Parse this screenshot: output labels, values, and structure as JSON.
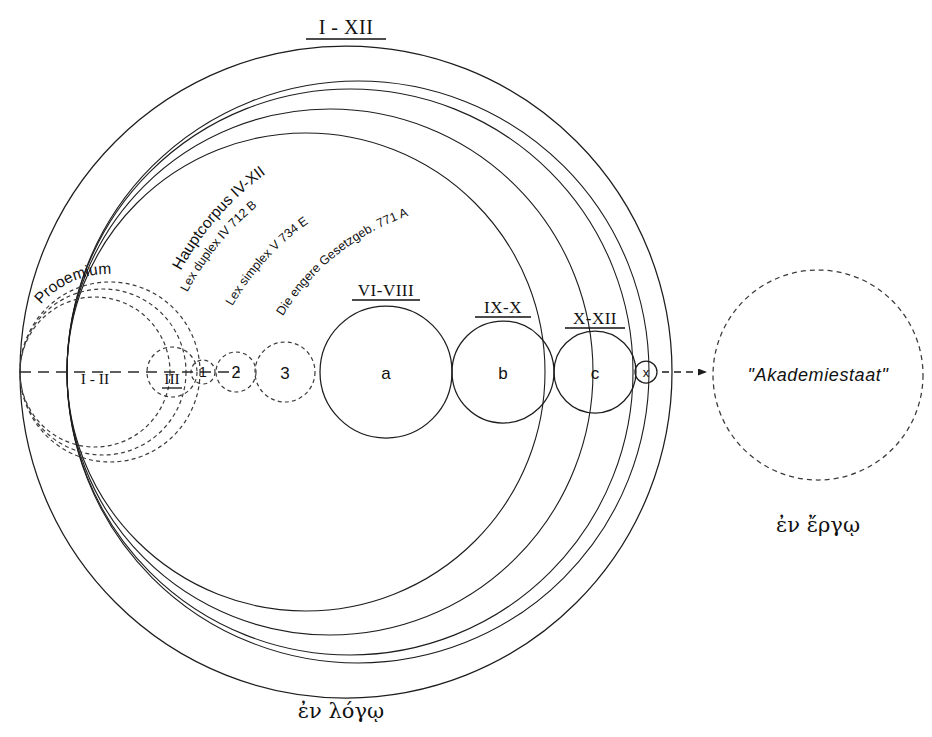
{
  "diagram": {
    "title_top": "I - XII",
    "bottom_caption": "ἐν λόγῳ",
    "right_caption": "ἐν ἔργῳ",
    "akademiestaat_label": "\"Akademiestaat\"",
    "transition_node_label": "x",
    "arrow_name": "dashed-arrow-to-akademiestaat"
  },
  "curved_labels": {
    "hauptcorpus": "Hauptcorpus  IV-XII",
    "lex_duplex": "Lex duplex IV 712 B",
    "lex_simplex": "Lex simplex V 734 E",
    "engere_gesetzgebung": "Die engere Gesetzgeb. 771 A",
    "prooemium": "Prooemium"
  },
  "dashed_sections": [
    {
      "id": "I-II",
      "label": "I - II",
      "cx": 95,
      "cy": 372,
      "r": 75
    },
    {
      "id": "III",
      "label": "III",
      "cx": 172,
      "cy": 372,
      "r": 25
    },
    {
      "id": "1",
      "label": "1",
      "cx": 203,
      "cy": 372,
      "r": 12
    },
    {
      "id": "2",
      "label": "2",
      "cx": 236,
      "cy": 372,
      "r": 20
    },
    {
      "id": "3",
      "label": "3",
      "cx": 285,
      "cy": 372,
      "r": 30
    }
  ],
  "solid_sections": [
    {
      "id": "a",
      "label": "a",
      "heading": "VI-VIII",
      "cx": 386,
      "cy": 372,
      "r": 66
    },
    {
      "id": "b",
      "label": "b",
      "heading": "IX-X",
      "cx": 503,
      "cy": 372,
      "r": 51
    },
    {
      "id": "c",
      "label": "c",
      "heading": "X-XII",
      "cx": 595,
      "cy": 372,
      "r": 41
    }
  ],
  "envelope_circles": [
    {
      "id": "outer-I-XII",
      "cx": 346,
      "cy": 372,
      "r": 326,
      "style": "solid"
    },
    {
      "id": "hauptcorpus",
      "cx": 358,
      "cy": 372,
      "r": 291,
      "style": "solid"
    },
    {
      "id": "lex-duplex",
      "cx": 350,
      "cy": 372,
      "r": 283,
      "style": "solid"
    },
    {
      "id": "lex-simplex",
      "cx": 330,
      "cy": 372,
      "r": 263,
      "style": "solid"
    },
    {
      "id": "engere-gesetzgebung",
      "cx": 306,
      "cy": 372,
      "r": 239,
      "style": "solid"
    },
    {
      "id": "prooemium-outer",
      "cx": 110,
      "cy": 372,
      "r": 90,
      "style": "dashed"
    },
    {
      "id": "prooemium-inner",
      "cx": 103,
      "cy": 372,
      "r": 83,
      "style": "dashed"
    }
  ],
  "akademiestaat_circle": {
    "cx": 818,
    "cy": 375,
    "r": 105
  },
  "axis": {
    "x1": 20,
    "y1": 372,
    "x2": 240,
    "y2": 372
  },
  "colors": {
    "ink": "#1d1d1d",
    "dashed_ink": "#3a3a3a",
    "background": "#ffffff"
  }
}
